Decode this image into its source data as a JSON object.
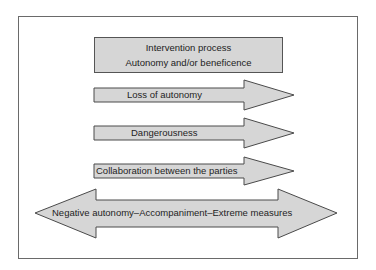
{
  "diagram": {
    "colors": {
      "fill": "#d6d6d6",
      "stroke": "#4a4a4a",
      "frame": "#6a6a6a",
      "text": "#1e1e1e"
    },
    "header": {
      "line1": "Intervention process",
      "line2": "Autonomy and/or beneficence"
    },
    "arrows": [
      {
        "label": "Loss of autonomy",
        "direction": "right"
      },
      {
        "label": "Dangerousness",
        "direction": "right"
      },
      {
        "label": "Collaboration between the parties",
        "direction": "right"
      }
    ],
    "double_arrow": {
      "label": "Negative autonomy–Accompaniment–Extreme measures",
      "direction": "both"
    }
  }
}
